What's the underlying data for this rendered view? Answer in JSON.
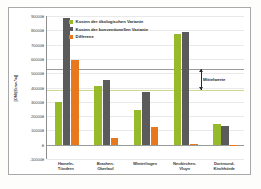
{
  "chart_data": {
    "type": "bar",
    "title": "",
    "xlabel": "",
    "ylabel": "[DM/(Einw.*a)]",
    "ylim": [
      -100000,
      900000
    ],
    "ytick_step": 100000,
    "yticks": [
      "900000",
      "800000",
      "700000",
      "600000",
      "500000",
      "400000",
      "300000",
      "200000",
      "100000",
      "0",
      "-100000"
    ],
    "grid": true,
    "legend_position": "top-inside-left",
    "categories": [
      "Hameln-\nTündern",
      "Brachen-\nOberlauf",
      "Winterlingen",
      "Neukirchen-\nVluyn",
      "Dortmund-\nKirchhörde"
    ],
    "series": [
      {
        "name": "Kosten der ökologischen Variante",
        "color": "#97ba2a",
        "values": [
          300000,
          413000,
          240000,
          775000,
          142000
        ]
      },
      {
        "name": "Kosten der konventionellen Variante",
        "color": "#5b5b5b",
        "values": [
          885000,
          455000,
          367000,
          785000,
          132000
        ]
      },
      {
        "name": "Differenz",
        "color": "#e8781e",
        "values": [
          590000,
          48000,
          123000,
          8000,
          -5000
        ]
      }
    ],
    "reference_lines": [
      {
        "label": "Mittelwert konventionell",
        "value": 530000,
        "color": "#9b9b9b"
      },
      {
        "label": "Mittelwert ökologisch",
        "value": 385000,
        "color": "#cdd98c"
      }
    ],
    "annotations": [
      {
        "text": "Mittelwerte",
        "from": 530000,
        "to": 385000
      }
    ]
  }
}
